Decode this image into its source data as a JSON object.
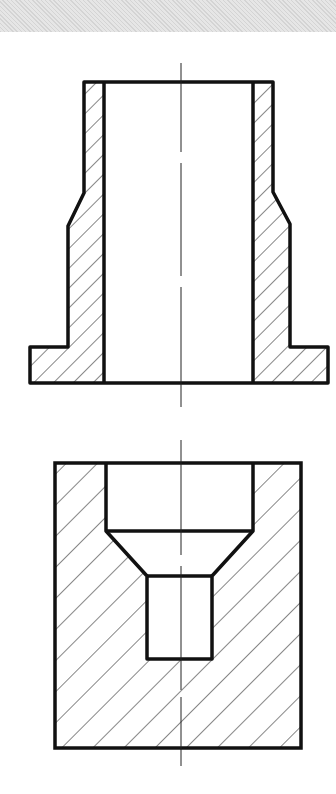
{
  "figure": {
    "type": "technical-drawing-cross-sections",
    "views": [
      {
        "name": "flanged-sleeve-section",
        "description": "Sectioned hollow sleeve with tapered transition and base flange"
      },
      {
        "name": "counterbored-block-section",
        "description": "Sectioned square block with counterbore, conical transition and small blind hole"
      }
    ],
    "colors": {
      "outline": "#111111",
      "hatch": "#222222",
      "background": "#ffffff",
      "band": "#dcdcdc"
    }
  }
}
